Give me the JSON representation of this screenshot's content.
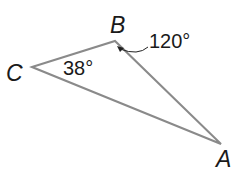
{
  "diagram": {
    "type": "triangle",
    "stroke_color": "#8a8a8a",
    "text_color": "#1a1a1a",
    "vertices": {
      "A": {
        "label": "A",
        "x": 221,
        "y": 144
      },
      "B": {
        "label": "B",
        "x": 115,
        "y": 41
      },
      "C": {
        "label": "C",
        "x": 32,
        "y": 67
      }
    },
    "angles": {
      "C": {
        "label": "38°",
        "value": 38
      },
      "B": {
        "label": "120°",
        "value": 120
      }
    }
  }
}
